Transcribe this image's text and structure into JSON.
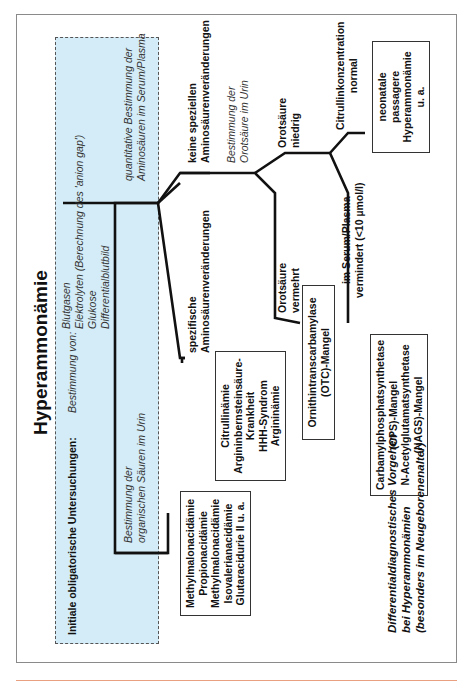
{
  "title": "Hyperammonämie",
  "initial": {
    "label": "Initiale obligatorische Untersuchungen:",
    "sublabel": "Bestimmung von:",
    "items": [
      "Blutgasen",
      "Elektrolyten (Berechnung des 'anion gap')",
      "Glukose",
      "Differentialblutbild"
    ]
  },
  "branches": {
    "organic_acids": {
      "line1": "Bestimmung der",
      "line2": "organischen Säuren im Urin"
    },
    "amino_acids": {
      "line1": "quantitative Bestimmung der",
      "line2": "Aminosäuren im Serum/Plasma"
    },
    "specific": {
      "line1": "spezifische",
      "line2": "Aminosäurenveränderungen"
    },
    "nonspecific": {
      "line1": "keine speziellen",
      "line2": "Aminosäurenveränderungen"
    },
    "orotic_test": {
      "line1": "Bestimmung der",
      "line2": "Orotsäure im Urin"
    },
    "orotic_high": {
      "line1": "Orotsäure",
      "line2": "vermehrt"
    },
    "orotic_low": {
      "line1": "Orotsäure",
      "line2": "niedrig"
    },
    "citrulline_low": {
      "line1": "im Serum/Plasma",
      "line2": "vermindert (<10 µmol/l)"
    },
    "citrulline_normal": {
      "line1": "Citrullinkonzentration",
      "line2": "normal"
    }
  },
  "boxes": {
    "organic_acidemias": [
      "Methylmalonacidämie",
      "Propionacidämie",
      "Methylmalonacidämie",
      "Isovalerianacidämie",
      "Glutaracidurie II u. a."
    ],
    "urea_cycle": [
      "Citrullinämie",
      "Argininbernsteinsäure-",
      "Krankheit",
      "HHH-Syndrom",
      "Argininämie"
    ],
    "otc": [
      "Ornithintranscarbamylase",
      "(OTC)-Mangel"
    ],
    "cps_nags": [
      "Carbamylphosphatsynthetase",
      "(CPS)-Mangel",
      "N-Acetylglutamatsynthetase",
      "(NAGS)-Mangel"
    ],
    "transient": [
      "neonatale",
      "passagere",
      "Hyperammonämie",
      "u. a."
    ]
  },
  "caption": {
    "line1": "Differentialdiagnostisches Vorgehen",
    "line2": "bei Hyperammonämien",
    "line3": "(besonders im Neugeborenenalter)"
  },
  "colors": {
    "highlight_box": "#d3ecf7",
    "rule": "#e8a080"
  }
}
